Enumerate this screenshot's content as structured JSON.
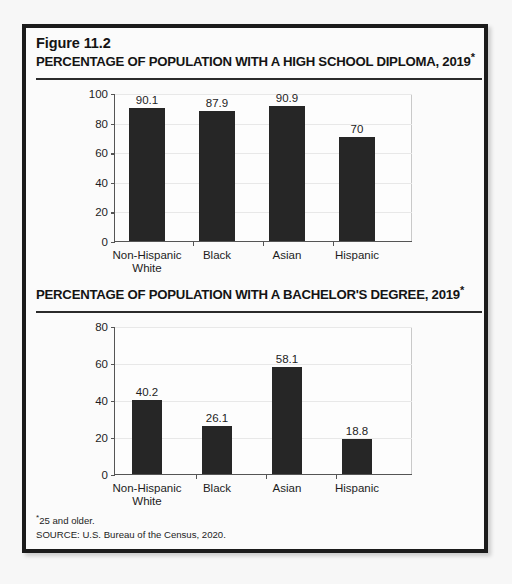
{
  "figure": {
    "number_label": "Figure 11.2",
    "footnote_marker": "*",
    "footnote_text": "25 and older.",
    "source_text": "SOURCE: U.S. Bureau of the Census, 2020."
  },
  "chart_data": [
    {
      "type": "bar",
      "title": "PERCENTAGE OF POPULATION WITH A HIGH SCHOOL DIPLOMA, 2019",
      "title_suffix": "*",
      "categories": [
        "Non-Hispanic White",
        "Black",
        "Asian",
        "Hispanic"
      ],
      "category_lines": [
        [
          "Non-Hispanic",
          "White"
        ],
        [
          "Black"
        ],
        [
          "Asian"
        ],
        [
          "Hispanic"
        ]
      ],
      "values": [
        90.1,
        87.9,
        90.9,
        70
      ],
      "value_labels": [
        "90.1",
        "87.9",
        "90.9",
        "70"
      ],
      "xlabel": "",
      "ylabel": "",
      "ylim": [
        0,
        100
      ],
      "yticks": [
        0,
        20,
        40,
        60,
        80,
        100
      ],
      "ytick_labels": [
        "0",
        "20",
        "40",
        "60",
        "80",
        "100"
      ],
      "grid": true,
      "legend": "none",
      "bar_color": "#262626"
    },
    {
      "type": "bar",
      "title": "PERCENTAGE OF POPULATION WITH A BACHELOR'S DEGREE, 2019",
      "title_suffix": "*",
      "categories": [
        "Non-Hispanic White",
        "Black",
        "Asian",
        "Hispanic"
      ],
      "category_lines": [
        [
          "Non-Hispanic",
          "White"
        ],
        [
          "Black"
        ],
        [
          "Asian"
        ],
        [
          "Hispanic"
        ]
      ],
      "values": [
        40.2,
        26.1,
        58.1,
        18.8
      ],
      "value_labels": [
        "40.2",
        "26.1",
        "58.1",
        "18.8"
      ],
      "xlabel": "",
      "ylabel": "",
      "ylim": [
        0,
        80
      ],
      "yticks": [
        0,
        20,
        40,
        60,
        80
      ],
      "ytick_labels": [
        "0",
        "20",
        "40",
        "60",
        "80"
      ],
      "grid": true,
      "legend": "none",
      "bar_color": "#262626"
    }
  ]
}
